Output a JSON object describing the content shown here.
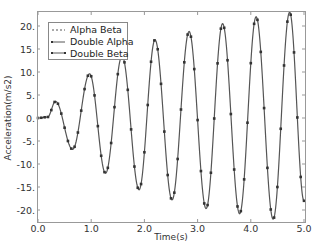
{
  "chart_data": {
    "type": "line",
    "title": "",
    "xlabel": "Time(s)",
    "ylabel": "Acceleration(m/s2)",
    "xlim": [
      0,
      5
    ],
    "ylim": [
      -22.5,
      23
    ],
    "grid": false,
    "legend_position": "upper left",
    "x_ticks": [
      "0.0",
      "1.0",
      "2.0",
      "3.0",
      "4.0",
      "5.0"
    ],
    "y_ticks": [
      "20.",
      "15.",
      "10.",
      "5.",
      "0.",
      "-5.",
      "-10.",
      "-15.",
      "-20."
    ],
    "y_tick_values": [
      20,
      15,
      10,
      5,
      0,
      -5,
      -10,
      -15,
      -20
    ],
    "extrema": [
      {
        "t": 0.0,
        "v": 0.0
      },
      {
        "t": 0.18,
        "v": 0.2
      },
      {
        "t": 0.33,
        "v": 3.6
      },
      {
        "t": 0.65,
        "v": -6.8
      },
      {
        "t": 0.97,
        "v": 9.6
      },
      {
        "t": 1.27,
        "v": -12.0
      },
      {
        "t": 1.58,
        "v": 13.5
      },
      {
        "t": 1.9,
        "v": -15.6
      },
      {
        "t": 2.2,
        "v": 17.0
      },
      {
        "t": 2.52,
        "v": -17.8
      },
      {
        "t": 2.84,
        "v": 18.8
      },
      {
        "t": 3.16,
        "v": -19.7
      },
      {
        "t": 3.47,
        "v": 20.5
      },
      {
        "t": 3.79,
        "v": -20.8
      },
      {
        "t": 4.1,
        "v": 22.0
      },
      {
        "t": 4.42,
        "v": -22.0
      },
      {
        "t": 4.73,
        "v": 23.0
      },
      {
        "t": 5.0,
        "v": -18.0
      }
    ],
    "series": [
      {
        "name": "Alpha Beta",
        "style": "dashed",
        "marker": "none"
      },
      {
        "name": "Double Alpha",
        "style": "solid",
        "marker": "square"
      },
      {
        "name": "Double Beta",
        "style": "solid",
        "marker": "square"
      }
    ],
    "sample_step": 0.0625
  },
  "legend": {
    "items": [
      "Alpha Beta",
      "Double Alpha",
      "Double Beta"
    ]
  },
  "axes": {
    "xlabel": "Time(s)",
    "ylabel": "Acceleration(m/s2)"
  },
  "colors": {
    "line": "#555555",
    "marker": "#333333",
    "axis": "#888888",
    "text": "#333333"
  }
}
